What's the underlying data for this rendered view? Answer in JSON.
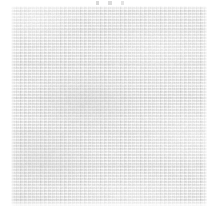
{
  "image": {
    "kind": "photograph",
    "subject": "woven-fabric-swatch",
    "description": "Close-up scan of a light grey woven textile (plain-weave linen/canvas) filling a near-square frame on a white background",
    "width_px": 214,
    "height_px": 212,
    "background_color": "#ffffff",
    "caption": "",
    "text_present": "none"
  },
  "swatch": {
    "label": "fabric-swatch",
    "left_px": 11,
    "top_px": 6,
    "width_px": 196,
    "height_px": 200,
    "base_color": "#e2e2e1",
    "highlight_color": "#f5f5f4",
    "shadow_color": "#bebebe",
    "weave": {
      "type": "plain-weave",
      "weft_direction": "horizontal",
      "warp_direction": "vertical",
      "weft_pitch_px": 3,
      "warp_pitch_px": 5,
      "cell_offset_px": 2,
      "banding_period_px": 34
    }
  },
  "margins": {
    "left_px": 11,
    "right_px": 7,
    "top_px": 6,
    "bottom_px": 6,
    "color": "#ffffff"
  },
  "artifacts": {
    "top_marks_label": "faint-scanner-marks",
    "top_marks_left_px": 86,
    "top_marks_top_px": 1,
    "top_marks_width_px": 46
  }
}
